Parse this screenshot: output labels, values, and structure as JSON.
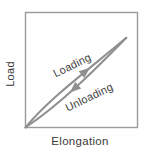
{
  "figure": {
    "curve_color": "#8f8f8f",
    "frame_color": "#9a9a9a",
    "text_color": "#3a3a3a",
    "labels": {
      "loading": "Loading",
      "unloading": "Unloading"
    }
  },
  "chart_data": {
    "type": "line",
    "title": "",
    "xlabel": "Elongation",
    "ylabel": "Load",
    "x_ticks": [],
    "y_ticks": [],
    "xlim": [
      0,
      1
    ],
    "ylim": [
      0,
      1
    ],
    "grid": false,
    "legend": "none (curves annotated inline)",
    "series": [
      {
        "name": "Loading",
        "x": [
          0,
          0.17,
          0.38,
          0.63,
          0.9
        ],
        "y": [
          0,
          0.18,
          0.36,
          0.56,
          0.78
        ],
        "bezier": [
          [
            0,
            0
          ],
          [
            0.2,
            0.24
          ],
          [
            0.52,
            0.47
          ],
          [
            0.9,
            0.78
          ]
        ],
        "arrow": {
          "tip": [
            0.576,
            0.52
          ],
          "angle": -39
        }
      },
      {
        "name": "Unloading",
        "x": [
          0.9,
          0.69,
          0.46,
          0.23,
          0
        ],
        "y": [
          0.78,
          0.57,
          0.36,
          0.17,
          0
        ],
        "bezier": [
          [
            0.9,
            0.78
          ],
          [
            0.62,
            0.5
          ],
          [
            0.31,
            0.2
          ],
          [
            0,
            0
          ]
        ],
        "arrow": {
          "tip": [
            0.3975,
            0.304
          ],
          "angle": 138
        }
      }
    ],
    "annotations": [
      "Loading",
      "Unloading"
    ]
  }
}
